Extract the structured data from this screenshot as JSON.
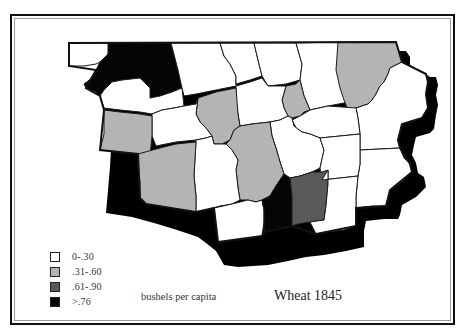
{
  "map": {
    "title": "Wheat 1845",
    "units_label": "bushels per capita",
    "colors": {
      "class_0": "#ffffff",
      "class_1": "#b4b4b4",
      "class_2": "#595959",
      "class_3": "#050505",
      "outline": "#1a1a1a",
      "shadow": "#000000"
    },
    "legend": [
      {
        "label": "0-.30",
        "class": "class_0"
      },
      {
        "label": ".31-.60",
        "class": "class_1"
      },
      {
        "label": ".61-.90",
        "class": "class_2"
      },
      {
        "label": ">.76",
        "class": "class_3"
      }
    ]
  }
}
